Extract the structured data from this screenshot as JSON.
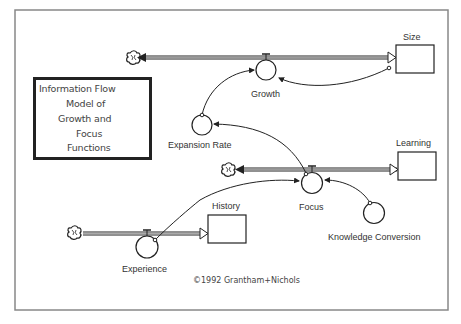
{
  "diagram": {
    "title_lines": [
      "Information Flow",
      "Model of",
      "Growth and",
      "Focus",
      "Functions"
    ],
    "copyright": "©1992 Grantham+Nichols",
    "stocks": [
      {
        "id": "size",
        "label": "Size"
      },
      {
        "id": "learning",
        "label": "Learning"
      },
      {
        "id": "history",
        "label": "History"
      }
    ],
    "flows": [
      {
        "id": "growth",
        "label": "Growth"
      },
      {
        "id": "focus",
        "label": "Focus"
      },
      {
        "id": "experience",
        "label": "Experience"
      }
    ],
    "converters": [
      {
        "id": "expansion_rate",
        "label": "Expansion Rate"
      },
      {
        "id": "knowledge_conversion",
        "label": "Knowledge Conversion"
      }
    ],
    "sources_sinks": [
      "cloud-growth",
      "cloud-focus",
      "cloud-experience"
    ],
    "connections": [
      {
        "from": "Expansion Rate",
        "to": "Growth"
      },
      {
        "from": "Size",
        "to": "Growth"
      },
      {
        "from": "Focus",
        "to": "Expansion Rate"
      },
      {
        "from": "History",
        "to": "Focus"
      },
      {
        "from": "Knowledge Conversion",
        "to": "Focus"
      },
      {
        "from": "Experience",
        "to": "History"
      }
    ],
    "colors": {
      "line": "#222222",
      "frame": "#888888",
      "text": "#333333"
    }
  }
}
